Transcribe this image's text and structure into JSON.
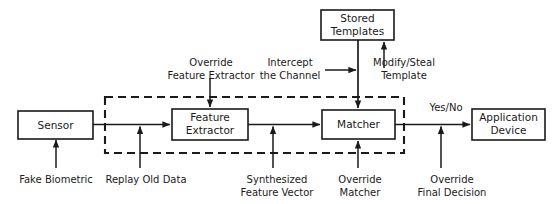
{
  "diagram": {
    "canvas": {
      "width": 559,
      "height": 204,
      "background": "#ffffff"
    },
    "stroke_color": "#1a1a1a",
    "nodes": [
      {
        "id": "sensor",
        "label": "Sensor",
        "line1": "Sensor",
        "line2": ""
      },
      {
        "id": "feature-extractor",
        "label": "Feature Extractor",
        "line1": "Feature",
        "line2": "Extractor"
      },
      {
        "id": "matcher",
        "label": "Matcher",
        "line1": "Matcher",
        "line2": ""
      },
      {
        "id": "stored-templates",
        "label": "Stored Templates",
        "line1": "Stored",
        "line2": "Templates"
      },
      {
        "id": "application-device",
        "label": "Application Device",
        "line1": "Application",
        "line2": "Device"
      }
    ],
    "edge_labels": [
      {
        "id": "yes-no",
        "label": "Yes/No"
      }
    ],
    "attack_labels": [
      {
        "id": "fake-biometric",
        "line1": "Fake Biometric",
        "line2": ""
      },
      {
        "id": "replay-old-data",
        "line1": "Replay Old Data",
        "line2": ""
      },
      {
        "id": "synthesized-feature-vector",
        "line1": "Synthesized",
        "line2": "Feature Vector"
      },
      {
        "id": "override-matcher",
        "line1": "Override",
        "line2": "Matcher"
      },
      {
        "id": "override-final-decision",
        "line1": "Override",
        "line2": "Final Decision"
      },
      {
        "id": "override-feature-extractor",
        "line1": "Override",
        "line2": "Feature Extractor"
      },
      {
        "id": "intercept-the-channel",
        "line1": "Intercept",
        "line2": "the Channel"
      },
      {
        "id": "modify-steal-template",
        "line1": "Modify/Steal",
        "line2": "Template"
      }
    ]
  }
}
